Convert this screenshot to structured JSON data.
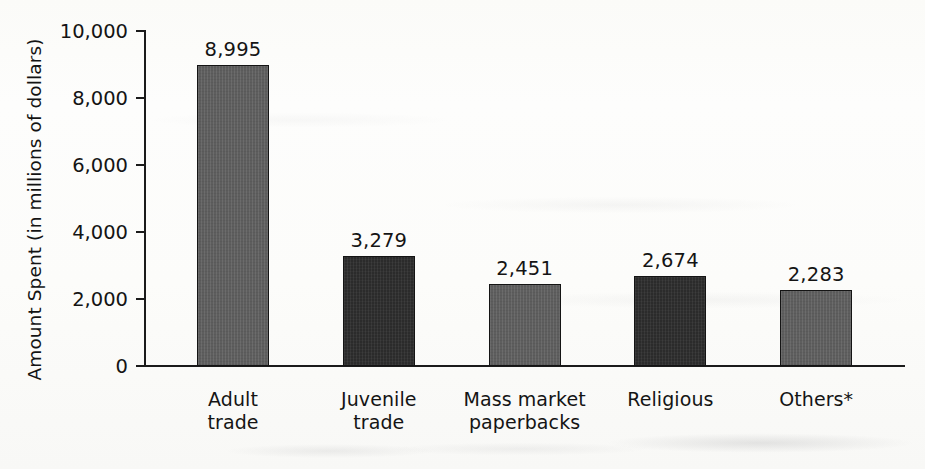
{
  "chart_data": {
    "type": "bar",
    "title": "",
    "xlabel": "",
    "ylabel": "Amount Spent (in millions of dollars)",
    "ylim": [
      0,
      10000
    ],
    "ytick_labels": [
      "0",
      "2,000",
      "4,000",
      "6,000",
      "8,000",
      "10,000"
    ],
    "ytick_values": [
      0,
      2000,
      4000,
      6000,
      8000,
      10000
    ],
    "grid": false,
    "legend": "none",
    "categories": [
      "Adult\ntrade",
      "Juvenile\ntrade",
      "Mass market\npaperbacks",
      "Religious",
      "Others*"
    ],
    "categories_line1": [
      "Adult",
      "Juvenile",
      "Mass market",
      "Religious",
      "Others*"
    ],
    "categories_line2": [
      "trade",
      "trade",
      "paperbacks",
      "",
      ""
    ],
    "values": [
      8995,
      3279,
      2451,
      2674,
      2283
    ],
    "value_labels": [
      "8,995",
      "3,279",
      "2,451",
      "2,674",
      "2,283"
    ],
    "bar_colors": [
      "#5e5e5e",
      "#2b2b2b",
      "#5e5e5e",
      "#2b2b2b",
      "#5e5e5e"
    ],
    "annotations": [
      "Others* denotes a footnote category"
    ]
  },
  "axis": {
    "y_title": "Amount Spent (in millions of dollars)"
  }
}
